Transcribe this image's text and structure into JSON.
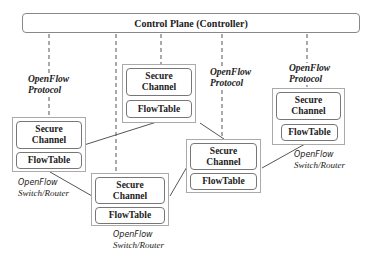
{
  "controller": {
    "label": "Control Plane (Controller)"
  },
  "protocol_labels": [
    {
      "line1": "OpenFlow",
      "line2": "Protocol"
    },
    {
      "line1": "OpenFlow",
      "line2": "Protocol"
    },
    {
      "line1": "OpenFlow",
      "line2": "Protocol"
    }
  ],
  "switches": [
    {
      "secure_channel": [
        "Secure",
        "Channel"
      ],
      "flowtable": "FlowTable",
      "label": [
        "OpenFlow",
        "Switch/Router"
      ]
    },
    {
      "secure_channel": [
        "Secure",
        "Channel"
      ],
      "flowtable": "FlowTable"
    },
    {
      "secure_channel": [
        "Secure",
        "Channel"
      ],
      "flowtable": "FlowTable",
      "label": [
        "OpenFlow",
        "Switch/Router"
      ]
    },
    {
      "secure_channel": [
        "Secure",
        "Channel"
      ],
      "flowtable": "FlowTable"
    },
    {
      "secure_channel": [
        "Secure",
        "Channel"
      ],
      "flowtable": "FlowTable",
      "label": [
        "OpenFlow",
        "Switch/Router"
      ]
    }
  ]
}
